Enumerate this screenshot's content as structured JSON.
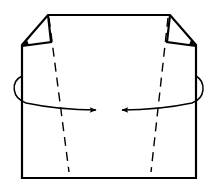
{
  "diagram": {
    "type": "origami-fold-step",
    "colors": {
      "background": "#ffffff",
      "line": "#000000"
    },
    "paper": {
      "outline": [
        [
          48,
          15
        ],
        [
          170,
          15
        ],
        [
          196,
          45
        ],
        [
          196,
          178
        ],
        [
          22,
          178
        ],
        [
          22,
          45
        ]
      ],
      "left_flap": [
        [
          48,
          15
        ],
        [
          51,
          42
        ],
        [
          22,
          46
        ]
      ],
      "right_flap": [
        [
          170,
          15
        ],
        [
          167,
          42
        ],
        [
          196,
          46
        ]
      ]
    },
    "fold_lines": [
      {
        "name": "left-valley-fold",
        "style": "dashed",
        "from": [
          49,
          18
        ],
        "to": [
          69,
          172
        ]
      },
      {
        "name": "right-valley-fold",
        "style": "dashed",
        "from": [
          168,
          18
        ],
        "to": [
          151,
          172
        ]
      }
    ],
    "arrows": [
      {
        "name": "left-fold-arrow",
        "direction": "right",
        "path": "M22,76 C10,82 12,98 26,103 C50,108 75,110 96,110",
        "head": [
          96,
          110
        ]
      },
      {
        "name": "right-fold-arrow",
        "direction": "left",
        "path": "M196,76 C206,82 206,98 192,103 C168,108 145,110 122,110",
        "head": [
          122,
          110
        ]
      }
    ]
  }
}
